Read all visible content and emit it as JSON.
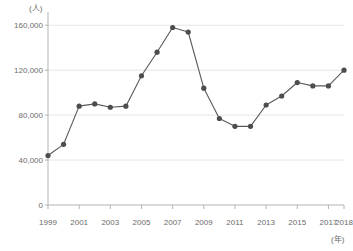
{
  "chart_data": {
    "type": "line",
    "title": "",
    "subtitle": "",
    "xlabel": "(年)",
    "ylabel": "(人)",
    "x": [
      1999,
      2000,
      2001,
      2002,
      2003,
      2004,
      2005,
      2006,
      2007,
      2008,
      2009,
      2010,
      2011,
      2012,
      2013,
      2014,
      2015,
      2016,
      2017,
      2018
    ],
    "values": [
      44000,
      54000,
      88000,
      90000,
      87000,
      88000,
      115000,
      136000,
      158000,
      154000,
      104000,
      77000,
      70000,
      70000,
      89000,
      97000,
      109000,
      106000,
      106000,
      120000
    ],
    "series": [
      {
        "name": "",
        "values": [
          44000,
          54000,
          88000,
          90000,
          87000,
          88000,
          115000,
          136000,
          158000,
          154000,
          104000,
          77000,
          70000,
          70000,
          89000,
          97000,
          109000,
          106000,
          106000,
          120000
        ]
      }
    ],
    "xlim": [
      1999,
      2018
    ],
    "ylim": [
      0,
      170000
    ],
    "y_ticks": [
      0,
      40000,
      80000,
      120000,
      160000
    ],
    "y_tick_labels": [
      "0",
      "40,000",
      "80,000",
      "120,000",
      "160,000"
    ],
    "x_ticks": [
      1999,
      2001,
      2003,
      2005,
      2007,
      2009,
      2011,
      2013,
      2015,
      2017,
      2018
    ],
    "x_tick_labels": [
      "1999",
      "2001",
      "2003",
      "2005",
      "2007",
      "2009",
      "2011",
      "2013",
      "2015",
      "2017",
      "2018"
    ],
    "grid": true,
    "grid_axis": "y",
    "legend": false,
    "legend_position": "none",
    "line_color": "#595959",
    "marker_color": "#4d4d4d",
    "grid_color": "#e6e6e6",
    "axis_color": "#b3b3b3",
    "marker": "circle"
  },
  "caption": {
    "text": ""
  }
}
